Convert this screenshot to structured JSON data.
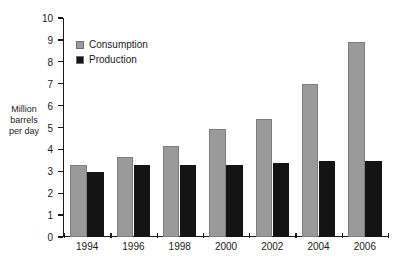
{
  "chart_data": {
    "type": "bar",
    "title": "",
    "xlabel": "",
    "ylabel": "Million barrels per day",
    "ylabel_lines": [
      "Million",
      "barrels",
      "per day"
    ],
    "categories": [
      "1994",
      "1996",
      "1998",
      "2000",
      "2002",
      "2004",
      "2006"
    ],
    "series": [
      {
        "name": "Consumption",
        "color": "#9a9a9a",
        "values": [
          3.3,
          3.65,
          4.15,
          4.95,
          5.4,
          7.0,
          8.9
        ]
      },
      {
        "name": "Production",
        "color": "#141414",
        "values": [
          2.95,
          3.3,
          3.3,
          3.3,
          3.4,
          3.45,
          3.45
        ]
      }
    ],
    "ylim": [
      0,
      10
    ],
    "ytick_step": 1,
    "yticks": [
      "10",
      "9",
      "8",
      "7",
      "6",
      "5",
      "4",
      "3",
      "2",
      "1",
      "0"
    ],
    "grid": false,
    "legend_position": "upper-left-inside",
    "background_color": "#ffffff",
    "axis_color": "#1a1a1a"
  }
}
